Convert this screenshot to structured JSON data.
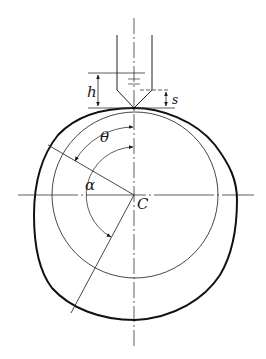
{
  "diagram": {
    "type": "cam-probe-geometry",
    "labels": {
      "h": "h",
      "s": "s",
      "theta": "θ",
      "alpha": "α",
      "center": "C"
    },
    "colors": {
      "stroke": "#1a1a1a",
      "thin_stroke": "#333333",
      "background": "#ffffff"
    }
  }
}
